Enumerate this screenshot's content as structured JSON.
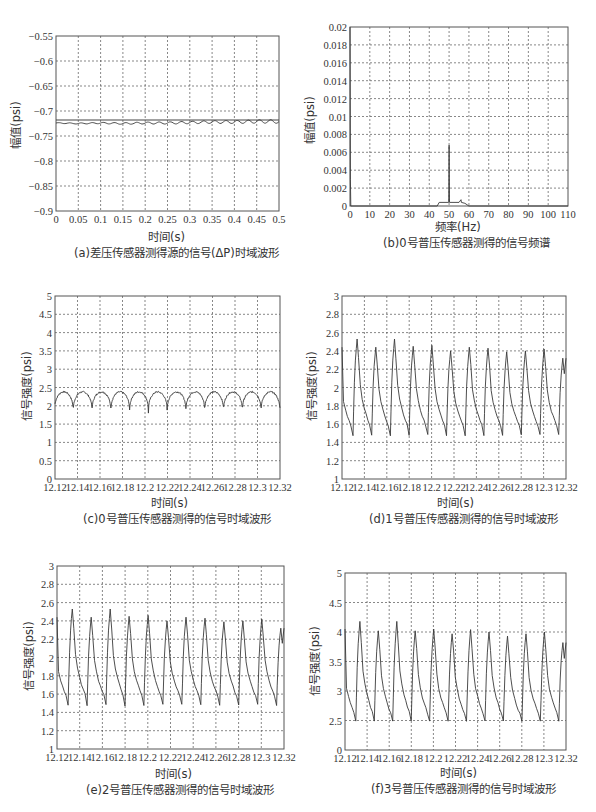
{
  "colors": {
    "axis": "#555555",
    "grid": "#555555",
    "line": "#3a3a3a",
    "ref_line": "#444444"
  },
  "chart_data": [
    {
      "id": "a",
      "type": "line",
      "title": "(a)差压传感器测得源的信号(ΔP)时域波形",
      "xlabel": "时间(s)",
      "ylabel": "幅值(psi)",
      "xlim": [
        0,
        0.5
      ],
      "ylim": [
        -0.9,
        -0.55
      ],
      "grid": true,
      "xticks": [
        "0",
        "0.05",
        "0.1",
        "0.15",
        "0.2",
        "0.25",
        "0.3",
        "0.35",
        "0.4",
        "0.45",
        "0.5"
      ],
      "yticks": [
        "-0.55",
        "-0.6",
        "-0.65",
        "-0.7",
        "-0.75",
        "-0.8",
        "-0.85",
        "-0.9"
      ],
      "series": [
        {
          "name": "reference",
          "x": [
            0,
            0.5
          ],
          "y": [
            -0.718,
            -0.718
          ]
        },
        {
          "name": "ΔP signal",
          "x": [
            0,
            0.05,
            0.1,
            0.15,
            0.2,
            0.25,
            0.3,
            0.35,
            0.4,
            0.45,
            0.5
          ],
          "y": [
            -0.724,
            -0.725,
            -0.724,
            -0.725,
            -0.724,
            -0.724,
            -0.723,
            -0.722,
            -0.722,
            -0.721,
            -0.721
          ],
          "ripple_amplitude": 0.002
        }
      ],
      "frame": {
        "left": 56,
        "top": 36,
        "right": 279,
        "bottom": 211
      }
    },
    {
      "id": "b",
      "type": "line",
      "title": "(b)0号普压传感器测得的信号频谱",
      "xlabel": "频率(Hz)",
      "ylabel": "幅值(psi)",
      "xlim": [
        0,
        110
      ],
      "ylim": [
        0,
        0.02
      ],
      "grid": true,
      "xticks": [
        "0",
        "10",
        "20",
        "30",
        "40",
        "50",
        "60",
        "70",
        "80",
        "90",
        "100",
        "110"
      ],
      "yticks": [
        "0.02",
        "0.018",
        "0.016",
        "0.014",
        "0.012",
        "0.01",
        "0.008",
        "0.006",
        "0.004",
        "0.002",
        "0"
      ],
      "series": [
        {
          "name": "spectrum",
          "x": [
            0,
            0.2,
            0.4,
            44,
            45,
            49.8,
            50,
            50.2,
            55,
            56,
            56.2,
            58,
            60,
            110
          ],
          "y": [
            0.02,
            0.003,
            0,
            0,
            0.0004,
            0.0004,
            0.0068,
            0.0004,
            0.0004,
            0.0007,
            0.0004,
            0.0003,
            0,
            0
          ]
        }
      ],
      "frame": {
        "left": 350,
        "top": 27,
        "right": 568,
        "bottom": 206
      }
    },
    {
      "id": "c",
      "type": "line",
      "title": "(c)0号普压传感器测得的信号时域波形",
      "xlabel": "时间(s)",
      "ylabel": "信号强度(psi)",
      "xlim": [
        12.12,
        12.32
      ],
      "ylim": [
        0,
        5
      ],
      "grid": true,
      "xticks": [
        "12.12",
        "12.14",
        "12.16",
        "12.18",
        "12.2",
        "12.22",
        "12.24",
        "12.26",
        "12.28",
        "12.3",
        "12.32"
      ],
      "yticks": [
        "5",
        "4.5",
        "4",
        "3.5",
        "3",
        "2.5",
        "2",
        "1.5",
        "1",
        "0.5",
        "0"
      ],
      "series": [
        {
          "name": "sensor 0",
          "period": 0.0167,
          "phase": 12.1195,
          "shape": "scallop",
          "min": 1.8,
          "max": 2.38,
          "noise": 0.04
        }
      ],
      "frame": {
        "left": 55,
        "top": 296,
        "right": 280,
        "bottom": 479
      }
    },
    {
      "id": "d",
      "type": "line",
      "title": "(d)1号普压传感器测得的信号时域波形",
      "xlabel": "时间(s)",
      "ylabel": "信号强度(psi)",
      "xlim": [
        12.12,
        12.32
      ],
      "ylim": [
        1,
        3
      ],
      "grid": true,
      "xticks": [
        "12.12",
        "12.14",
        "12.16",
        "12.18",
        "12.2",
        "12.22",
        "12.24",
        "12.26",
        "12.28",
        "12.3",
        "12.32"
      ],
      "yticks": [
        "3",
        "2.8",
        "2.6",
        "2.4",
        "2.2",
        "2",
        "1.8",
        "1.6",
        "1.4",
        "1.2",
        "1"
      ],
      "series": [
        {
          "name": "sensor 1",
          "period": 0.0167,
          "phase": 12.1206,
          "shape": "sawtooth",
          "min": 1.48,
          "peaks": [
            2.44,
            2.53,
            2.44,
            2.53,
            2.45,
            2.46,
            2.4,
            2.44,
            2.43,
            2.39,
            2.4,
            2.42,
            2.32
          ]
        }
      ],
      "frame": {
        "left": 342,
        "top": 296,
        "right": 566,
        "bottom": 479
      }
    },
    {
      "id": "e",
      "type": "line",
      "title": "(e)2号普压传感器测得的信号时域波形",
      "xlabel": "时间(s)",
      "ylabel": "信号强度(psi)",
      "xlim": [
        12.12,
        12.32
      ],
      "ylim": [
        1,
        3
      ],
      "grid": true,
      "xticks": [
        "12.12",
        "12.14",
        "12.16",
        "12.18",
        "12.2",
        "12.22",
        "12.24",
        "12.26",
        "12.28",
        "12.3",
        "12.32"
      ],
      "yticks": [
        "3",
        "2.8",
        "2.6",
        "2.4",
        "2.2",
        "2",
        "1.8",
        "1.6",
        "1.4",
        "1.2",
        "1"
      ],
      "series": [
        {
          "name": "sensor 2",
          "period": 0.0167,
          "phase": 12.1206,
          "shape": "sawtooth",
          "min": 1.48,
          "peaks": [
            2.44,
            2.53,
            2.44,
            2.53,
            2.45,
            2.46,
            2.4,
            2.44,
            2.43,
            2.39,
            2.4,
            2.42,
            2.32
          ]
        }
      ],
      "frame": {
        "left": 57,
        "top": 566,
        "right": 284,
        "bottom": 749
      }
    },
    {
      "id": "f",
      "type": "line",
      "title": "(f)3号普压传感器测得的信号时域波形",
      "xlabel": "时间(s)",
      "ylabel": "信号强度(psi)",
      "xlim": [
        12.12,
        12.32
      ],
      "ylim": [
        0,
        5
      ],
      "y_axis_note": "broken axis: ticks evenly spaced 0, 2.5, 3, 3.5, 4, 4.5, 5",
      "grid": true,
      "xticks": [
        "12.12",
        "12.14",
        "12.16",
        "12.18",
        "12.2",
        "12.22",
        "12.24",
        "12.26",
        "12.28",
        "12.3",
        "12.32"
      ],
      "yticks": [
        "5",
        "4.5",
        "4",
        "3.5",
        "3",
        "2.5",
        "0"
      ],
      "series": [
        {
          "name": "sensor 3",
          "period": 0.0167,
          "phase": 12.1206,
          "shape": "sawtooth",
          "min": 2.45,
          "peaks": [
            4.05,
            4.18,
            4.02,
            4.18,
            4.02,
            4.05,
            3.97,
            4.04,
            4.0,
            3.93,
            3.97,
            4.0,
            3.82
          ]
        }
      ],
      "frame": {
        "left": 345,
        "top": 573,
        "right": 566,
        "bottom": 750
      }
    }
  ],
  "panels": {
    "a": {
      "xlabel": "时间(s)",
      "ylabel": "幅值(psi)",
      "caption": "(a)差压传感器测得源的信号(ΔP)时域波形"
    },
    "b": {
      "xlabel": "频率(Hz)",
      "ylabel": "幅值(psi)",
      "caption": "(b)0号普压传感器测得的信号频谱"
    },
    "c": {
      "xlabel": "时间(s)",
      "ylabel": "信号强度(psi)",
      "caption": "(c)0号普压传感器测得的信号时域波形"
    },
    "d": {
      "xlabel": "时间(s)",
      "ylabel": "信号强度(psi)",
      "caption": "(d)1号普压传感器测得的信号时域波形"
    },
    "e": {
      "xlabel": "时间(s)",
      "ylabel": "信号强度(psi)",
      "caption": "(e)2号普压传感器测得的信号时域波形"
    },
    "f": {
      "xlabel": "时间(s)",
      "ylabel": "信号强度(psi)",
      "caption": "(f)3号普压传感器测得的信号时域波形"
    }
  }
}
